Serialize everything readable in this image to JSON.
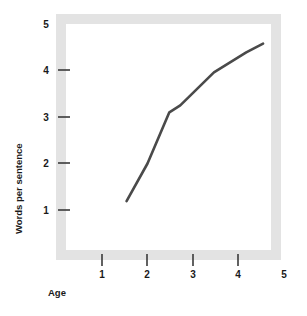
{
  "chart_data": {
    "type": "line",
    "title": "",
    "subtitle": "",
    "xlabel": "Age",
    "ylabel": "Words per sentence",
    "xlim": [
      0.5,
      5.4
    ],
    "ylim": [
      0.3,
      5.25
    ],
    "xticks": [
      1,
      2,
      3,
      4,
      5
    ],
    "yticks": [
      1,
      2,
      3,
      4,
      5
    ],
    "xtick_labels": [
      "1",
      "2",
      "3",
      "4",
      "5"
    ],
    "ytick_labels": [
      "1",
      "2",
      "3",
      "4",
      "5"
    ],
    "grid": false,
    "legend": null,
    "legend_position": "none",
    "series": [
      {
        "name": "Words per sentence",
        "color": "#4a4a4a",
        "line_width": 2.6,
        "markers": false,
        "x": [
          1.54,
          2.0,
          2.48,
          2.72,
          3.46,
          4.17,
          4.54
        ],
        "y": [
          1.19,
          2.0,
          3.1,
          3.25,
          3.96,
          4.39,
          4.58
        ]
      }
    ]
  },
  "figure": {
    "frame_color": "#e3e3e3",
    "frame_thickness": 10,
    "plot_background": "#ffffff",
    "tick_color": "#3a3a3a",
    "axis_label_color": "#1a1a1a"
  },
  "axes": {
    "y": {
      "title": "Words per sentence",
      "labels": [
        {
          "text": "5",
          "value": 5
        },
        {
          "text": "4",
          "value": 4
        },
        {
          "text": "3",
          "value": 3
        },
        {
          "text": "2",
          "value": 2
        },
        {
          "text": "1",
          "value": 1
        }
      ]
    },
    "x": {
      "title": "Age",
      "labels": [
        {
          "text": "1",
          "value": 1
        },
        {
          "text": "2",
          "value": 2
        },
        {
          "text": "3",
          "value": 3
        },
        {
          "text": "4",
          "value": 4
        },
        {
          "text": "5",
          "value": 5
        }
      ]
    }
  }
}
